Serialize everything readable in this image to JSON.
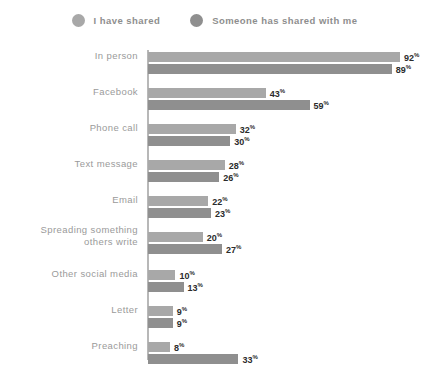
{
  "legend": {
    "entries": [
      {
        "label": "I have shared",
        "color": "#a8a8a8",
        "icon": "circle-swatch-icon"
      },
      {
        "label": "Someone has shared with me",
        "color": "#8f8f8f",
        "icon": "circle-swatch-icon"
      }
    ]
  },
  "chart_data": {
    "type": "bar",
    "orientation": "horizontal",
    "title": "",
    "subtitle": "",
    "xlabel": "",
    "ylabel": "",
    "grid": false,
    "legend_position": "top-center",
    "value_suffix": "%",
    "xlim": [
      0,
      100
    ],
    "axis_ticks_visible": false,
    "categories": [
      "In person",
      "Facebook",
      "Phone call",
      "Text message",
      "Email",
      "Spreading something others write",
      "Other social media",
      "Letter",
      "Preaching"
    ],
    "category_lines": [
      [
        "In person"
      ],
      [
        "Facebook"
      ],
      [
        "Phone call"
      ],
      [
        "Text message"
      ],
      [
        "Email"
      ],
      [
        "Spreading something",
        "others write"
      ],
      [
        "Other social media"
      ],
      [
        "Letter"
      ],
      [
        "Preaching"
      ]
    ],
    "series": [
      {
        "name": "I have shared",
        "color": "#a8a8a8",
        "values": [
          92,
          43,
          32,
          28,
          22,
          20,
          10,
          9,
          8
        ],
        "labels": [
          "92%",
          "43%",
          "32%",
          "28%",
          "22%",
          "20%",
          "10%",
          "9%",
          "8%"
        ]
      },
      {
        "name": "Someone has shared with me",
        "color": "#8f8f8f",
        "values": [
          89,
          59,
          30,
          26,
          23,
          27,
          13,
          9,
          33
        ],
        "labels": [
          "89%",
          "59%",
          "30%",
          "26%",
          "23%",
          "27%",
          "13%",
          "9%",
          "33%"
        ]
      }
    ]
  },
  "style": {
    "axis_color": "#b8b8b8",
    "label_color": "#9a9a9a",
    "value_color": "#2b2b2b",
    "legend_label_color": "#8e8e8e",
    "background": "#ffffff"
  }
}
